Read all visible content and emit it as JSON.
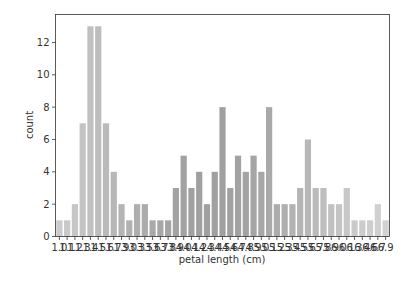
{
  "chart_data": {
    "type": "bar",
    "title": "",
    "xlabel": "petal length (cm)",
    "ylabel": "count",
    "ylim": [
      0,
      13.73
    ],
    "yticks": [
      0,
      2,
      4,
      6,
      8,
      10,
      12
    ],
    "grid": false,
    "legend": null,
    "categories": [
      "1.0",
      "1.1",
      "1.2",
      "1.3",
      "1.4",
      "1.5",
      "1.6",
      "1.7",
      "1.9",
      "3.0",
      "3.3",
      "3.5",
      "3.6",
      "3.7",
      "3.8",
      "3.9",
      "4.0",
      "4.1",
      "4.2",
      "4.3",
      "4.4",
      "4.5",
      "4.6",
      "4.7",
      "4.8",
      "4.9",
      "5.0",
      "5.1",
      "5.2",
      "5.3",
      "5.4",
      "5.5",
      "5.6",
      "5.7",
      "5.8",
      "5.9",
      "6.0",
      "6.1",
      "6.3",
      "6.4",
      "6.6",
      "6.7",
      "6.9"
    ],
    "values": [
      1,
      1,
      2,
      7,
      13,
      13,
      7,
      4,
      2,
      1,
      2,
      2,
      1,
      1,
      1,
      3,
      5,
      3,
      4,
      2,
      4,
      8,
      3,
      5,
      4,
      5,
      4,
      8,
      2,
      2,
      2,
      3,
      6,
      3,
      3,
      2,
      2,
      3,
      1,
      1,
      1,
      2,
      1
    ],
    "tick_labels_rendered": [
      "1",
      "1",
      "1",
      "1",
      "1",
      "1",
      "1",
      "1",
      "1",
      "3",
      "3",
      "3",
      "3",
      "3",
      "3",
      "3",
      "4",
      "4",
      "4",
      "4",
      "4",
      "4",
      "4",
      "4",
      "4",
      "4",
      "5",
      "5",
      "5",
      "5",
      "5",
      "5",
      "5",
      "5",
      "5",
      "5",
      "6",
      "6",
      "6",
      "6",
      "6",
      "6",
      "6"
    ],
    "bar_colors": [
      "#cbcbcb",
      "#c9c9c9",
      "#c6c6c6",
      "#c3c3c3",
      "#c0c0c0",
      "#bdbdbd",
      "#bababa",
      "#b7b7b7",
      "#b4b4b4",
      "#b1b1b1",
      "#aeaeae",
      "#ababab",
      "#a9a9a9",
      "#a7a7a7",
      "#a5a5a5",
      "#a3a3a3",
      "#a2a2a2",
      "#a1a1a1",
      "#a0a0a0",
      "#a0a0a0",
      "#a0a0a0",
      "#a0a0a0",
      "#a1a1a1",
      "#a2a2a2",
      "#a3a3a3",
      "#a5a5a5",
      "#a7a7a7",
      "#a9a9a9",
      "#acacac",
      "#afafaf",
      "#b2b2b2",
      "#b5b5b5",
      "#b8b8b8",
      "#bbbbbb",
      "#bebebe",
      "#c1c1c1",
      "#c4c4c4",
      "#c7c7c7",
      "#cacaca",
      "#cccccc",
      "#cecece",
      "#d0d0d0",
      "#d2d2d2"
    ]
  },
  "axes": {
    "frame_color": "#333333",
    "tick_color": "#333333"
  }
}
